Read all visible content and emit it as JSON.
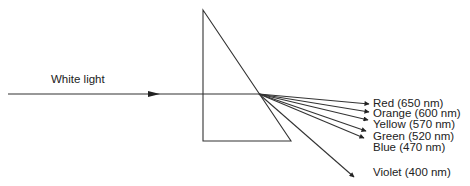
{
  "diagram": {
    "input_label": "White light",
    "colors": {
      "line": "#333333",
      "text": "#222222",
      "background": "#ffffff"
    },
    "rays": [
      {
        "name": "red",
        "label": "Red (650 nm)"
      },
      {
        "name": "orange",
        "label": "Orange (600 nm)"
      },
      {
        "name": "yellow",
        "label": "Yellow (570 nm)"
      },
      {
        "name": "green",
        "label": "Green (520 nm)"
      },
      {
        "name": "blue",
        "label": "Blue (470 nm)"
      },
      {
        "name": "violet",
        "label": "Violet (400 nm)"
      }
    ]
  }
}
